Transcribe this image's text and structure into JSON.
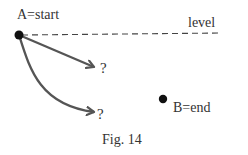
{
  "figure": {
    "caption": "Fig. 14",
    "point_a": {
      "label": "A=start",
      "x": 19,
      "y": 35
    },
    "point_b": {
      "label": "B=end",
      "x": 163,
      "y": 99
    },
    "level_line": {
      "label": "level",
      "style": "dashed"
    },
    "paths": [
      {
        "type": "straight",
        "label": "?"
      },
      {
        "type": "curved",
        "label": "?"
      }
    ],
    "colors": {
      "dot": "#111111",
      "arrow": "#555555",
      "dashed": "#444444",
      "text": "#333333"
    }
  }
}
